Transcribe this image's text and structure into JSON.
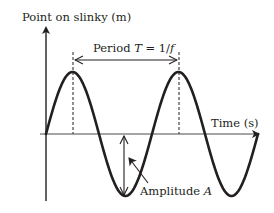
{
  "diagram": {
    "y_axis_label": "Point on slinky (m)",
    "x_axis_label": "Time (s)",
    "period_label_prefix": "Period ",
    "period_symbol": "T",
    "period_equals": " = 1/",
    "period_freq_symbol": "f",
    "amplitude_label_prefix": "Amplitude ",
    "amplitude_symbol": "A",
    "colors": {
      "line": "#231f20",
      "axis": "#4d4d4d",
      "background": "#ffffff"
    },
    "wave": {
      "type": "sine",
      "cycles_shown": 2,
      "origin_px": [
        46,
        134
      ],
      "period_px": 106,
      "amplitude_px": 62
    }
  }
}
